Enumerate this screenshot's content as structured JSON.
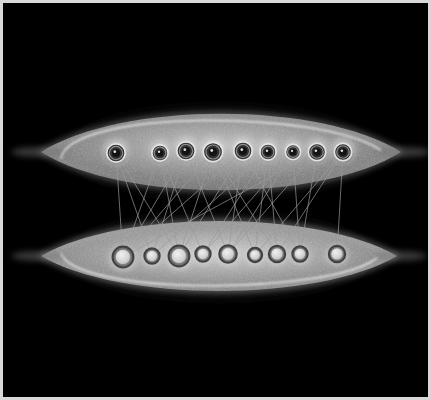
{
  "figure": {
    "background_color": "#000000",
    "frame_color": "#d8d8d8",
    "canvas_width": 431,
    "canvas_height": 400
  },
  "chart_data": {
    "type": "scatter",
    "subtitle": "",
    "xlabel": "",
    "ylabel": "",
    "grid": false,
    "legend_position": "none",
    "xlim": [
      0,
      431
    ],
    "ylim": [
      0,
      400
    ],
    "groups": [
      {
        "name": "top-cluster",
        "label": "Upper lens group",
        "lens": {
          "cx": 221,
          "cy": 152,
          "rx": 180,
          "ry": 48,
          "fill": "#8e8e8e",
          "contour_color": "#f2f2f2",
          "glow_color": "#5a5a5a"
        },
        "node_style": {
          "core_color": "#131313",
          "ring_color": "#e6e6e6",
          "halo_color": "#b4b4b4"
        },
        "nodes": [
          {
            "id": "T1",
            "x": 116,
            "y": 153,
            "r": 8.5
          },
          {
            "id": "T2",
            "x": 160,
            "y": 153,
            "r": 7.5
          },
          {
            "id": "T3",
            "x": 186,
            "y": 151,
            "r": 8.5
          },
          {
            "id": "T4",
            "x": 213,
            "y": 152,
            "r": 9.0
          },
          {
            "id": "T5",
            "x": 243,
            "y": 151,
            "r": 8.5
          },
          {
            "id": "T6",
            "x": 268,
            "y": 152,
            "r": 7.5
          },
          {
            "id": "T7",
            "x": 293,
            "y": 152,
            "r": 7.0
          },
          {
            "id": "T8",
            "x": 317,
            "y": 152,
            "r": 8.0
          },
          {
            "id": "T9",
            "x": 343,
            "y": 152,
            "r": 8.0
          }
        ]
      },
      {
        "name": "bottom-cluster",
        "label": "Lower lens group",
        "lens": {
          "cx": 219,
          "cy": 256,
          "rx": 178,
          "ry": 44,
          "fill": "#a3a3a3",
          "contour_color": "#f2f2f2",
          "glow_color": "#5f5f5f"
        },
        "node_style": {
          "core_color": "#d9d9d9",
          "ring_color": "#3a3a3a",
          "halo_color": "#c8c8c8"
        },
        "nodes": [
          {
            "id": "B1",
            "x": 123,
            "y": 257,
            "r": 9.5
          },
          {
            "id": "B2",
            "x": 152,
            "y": 256,
            "r": 7.0
          },
          {
            "id": "B3",
            "x": 179,
            "y": 256,
            "r": 9.5
          },
          {
            "id": "B4",
            "x": 203,
            "y": 254,
            "r": 7.0
          },
          {
            "id": "B5",
            "x": 228,
            "y": 254,
            "r": 8.0
          },
          {
            "id": "B6",
            "x": 255,
            "y": 255,
            "r": 6.5
          },
          {
            "id": "B7",
            "x": 277,
            "y": 254,
            "r": 7.5
          },
          {
            "id": "B8",
            "x": 300,
            "y": 254,
            "r": 7.0
          },
          {
            "id": "B9",
            "x": 337,
            "y": 254,
            "r": 7.5
          }
        ]
      }
    ],
    "edges": [
      {
        "from": "T1",
        "to": "B1"
      },
      {
        "from": "T1",
        "to": "B3"
      },
      {
        "from": "T2",
        "to": "B3"
      },
      {
        "from": "T2",
        "to": "B4"
      },
      {
        "from": "T3",
        "to": "B1"
      },
      {
        "from": "T3",
        "to": "B2"
      },
      {
        "from": "T3",
        "to": "B5"
      },
      {
        "from": "T4",
        "to": "B1"
      },
      {
        "from": "T4",
        "to": "B3"
      },
      {
        "from": "T4",
        "to": "B6"
      },
      {
        "from": "T4",
        "to": "B7"
      },
      {
        "from": "T5",
        "to": "B3"
      },
      {
        "from": "T5",
        "to": "B5"
      },
      {
        "from": "T5",
        "to": "B8"
      },
      {
        "from": "T6",
        "to": "B2"
      },
      {
        "from": "T6",
        "to": "B6"
      },
      {
        "from": "T6",
        "to": "B7"
      },
      {
        "from": "T7",
        "to": "B4"
      },
      {
        "from": "T7",
        "to": "B5"
      },
      {
        "from": "T8",
        "to": "B1"
      },
      {
        "from": "T8",
        "to": "B5"
      },
      {
        "from": "T8",
        "to": "B8"
      },
      {
        "from": "T9",
        "to": "B6"
      },
      {
        "from": "T9",
        "to": "B9"
      },
      {
        "from": "T2",
        "to": "B1"
      },
      {
        "from": "T5",
        "to": "B1"
      },
      {
        "from": "T7",
        "to": "B8"
      },
      {
        "from": "T6",
        "to": "B4"
      },
      {
        "from": "T9",
        "to": "B7"
      },
      {
        "from": "T1",
        "to": "B2"
      }
    ],
    "edge_style": {
      "color": "#9a9a9a",
      "width": 0.8,
      "count": 30
    },
    "counts": {
      "top_nodes": 9,
      "bottom_nodes": 9,
      "edges": 30
    }
  }
}
